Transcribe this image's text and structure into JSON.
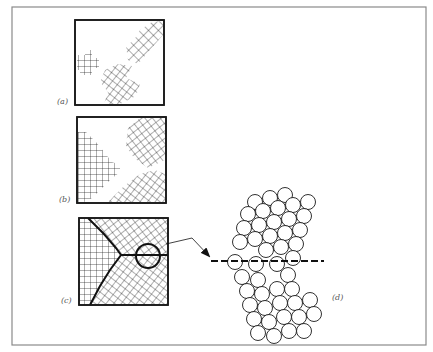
{
  "figure": {
    "frame_color": "#8a8a8a",
    "ink_color": "#1a1a1a",
    "label_color": "#555555",
    "panels": [
      {
        "id": "a",
        "label": "(a)",
        "description": "Isolated crystal nuclei with lattice hatching in random orientations"
      },
      {
        "id": "b",
        "label": "(b)",
        "description": "Growing grains of different orientation"
      },
      {
        "id": "c",
        "label": "(c)",
        "description": "Fully solidified grains meeting at grain boundaries with a circled boundary region"
      },
      {
        "id": "d",
        "label": "(d)",
        "description": "Atomic-scale view of circled grain boundary showing close-packed atoms with dashed boundary line"
      }
    ],
    "callout": {
      "from_panel": "c",
      "to_panel": "d",
      "arrow": "arrow-right-icon",
      "dashed_line": true
    }
  }
}
